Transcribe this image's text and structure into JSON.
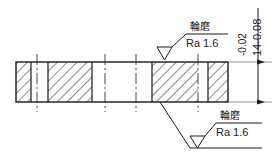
{
  "drawing": {
    "type": "mechanical-section-view",
    "title": "",
    "line_color": "#1a1a1a",
    "hatch_color": "#1a1a1a",
    "background": "#ffffff",
    "body": {
      "name": "shaft-section-body",
      "x": 16,
      "y": 62,
      "width": 212,
      "height": 40
    },
    "hatched_sections": [
      {
        "name": "hatch-block-1",
        "x": 16,
        "y": 62,
        "width": 15,
        "height": 40
      },
      {
        "name": "hatch-block-2",
        "x": 48,
        "y": 62,
        "width": 44,
        "height": 40
      },
      {
        "name": "hatch-block-3",
        "x": 152,
        "y": 62,
        "width": 46,
        "height": 40
      },
      {
        "name": "hatch-block-4",
        "x": 208,
        "y": 62,
        "width": 20,
        "height": 40
      }
    ],
    "center_lines": [
      {
        "name": "center-line-1",
        "x": 37
      },
      {
        "name": "center-line-2",
        "x": 105
      },
      {
        "name": "center-line-3",
        "x": 136
      },
      {
        "name": "center-line-4",
        "x": 198
      }
    ],
    "section_dividers": [
      {
        "name": "divider-left-inner",
        "x": 31
      },
      {
        "name": "divider-mid-a",
        "x": 48
      },
      {
        "name": "divider-mid-b",
        "x": 92
      },
      {
        "name": "divider-mid-c",
        "x": 152
      },
      {
        "name": "divider-right-inner",
        "x": 208
      }
    ]
  },
  "dimension": {
    "name": "height-dimension",
    "nominal": "14",
    "upper_tolerance": "-0.02",
    "lower_tolerance": "-0.08",
    "combined_label": "14-0.08",
    "orientation": "vertical",
    "rotated_degrees": -90
  },
  "surface_finish_top": {
    "name": "surface-finish-callout-top",
    "process": "輪磨",
    "roughness": "Ra 1.6",
    "symbol": "triangle-check"
  },
  "surface_finish_bottom": {
    "name": "surface-finish-callout-bottom",
    "process": "輪磨",
    "roughness": "Ra 1.6",
    "symbol": "triangle-check"
  }
}
